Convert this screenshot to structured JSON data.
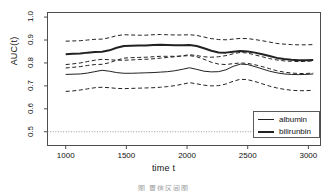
{
  "chart_data": {
    "type": "line",
    "title": "",
    "xlabel": "time t",
    "ylabel": "AUC(t)",
    "xlim": [
      850,
      3100
    ],
    "ylim": [
      0.44,
      1.02
    ],
    "xticks": [
      "1000",
      "1500",
      "2000",
      "2500",
      "3000"
    ],
    "xtick_values": [
      1000,
      1500,
      2000,
      2500,
      3000
    ],
    "yticks": [
      "0.5",
      "0.6",
      "0.7",
      "0.8",
      "0.9",
      "1.0"
    ],
    "ytick_values": [
      0.5,
      0.6,
      0.7,
      0.8,
      0.9,
      1.0
    ],
    "grid": false,
    "legend_position": "bottom-right",
    "reference_line": {
      "y": 0.5,
      "style": "dotted",
      "color": "#999999"
    },
    "series": [
      {
        "name": "albumin",
        "style": "solid",
        "width": 1,
        "color": "#222222",
        "x": [
          1000,
          1060,
          1120,
          1180,
          1240,
          1300,
          1360,
          1420,
          1480,
          1540,
          1600,
          1660,
          1720,
          1780,
          1840,
          1900,
          1960,
          2020,
          2080,
          2140,
          2200,
          2260,
          2320,
          2380,
          2440,
          2500,
          2560,
          2620,
          2680,
          2740,
          2800,
          2860,
          2920,
          2980,
          3040
        ],
        "values": [
          0.75,
          0.751,
          0.752,
          0.756,
          0.762,
          0.768,
          0.764,
          0.758,
          0.755,
          0.755,
          0.756,
          0.757,
          0.758,
          0.76,
          0.762,
          0.766,
          0.772,
          0.779,
          0.772,
          0.764,
          0.761,
          0.762,
          0.77,
          0.785,
          0.795,
          0.793,
          0.784,
          0.774,
          0.764,
          0.757,
          0.752,
          0.75,
          0.749,
          0.75,
          0.752
        ]
      },
      {
        "name": "bilirunbin",
        "style": "solid",
        "width": 2,
        "color": "#222222",
        "x": [
          1000,
          1060,
          1120,
          1180,
          1240,
          1300,
          1360,
          1420,
          1480,
          1540,
          1600,
          1660,
          1720,
          1780,
          1840,
          1900,
          1960,
          2020,
          2080,
          2140,
          2200,
          2260,
          2320,
          2380,
          2440,
          2500,
          2560,
          2620,
          2680,
          2740,
          2800,
          2860,
          2920,
          2980,
          3040
        ],
        "values": [
          0.838,
          0.84,
          0.841,
          0.845,
          0.848,
          0.849,
          0.855,
          0.866,
          0.874,
          0.875,
          0.876,
          0.876,
          0.878,
          0.879,
          0.878,
          0.877,
          0.877,
          0.878,
          0.874,
          0.864,
          0.853,
          0.846,
          0.845,
          0.849,
          0.852,
          0.85,
          0.845,
          0.838,
          0.83,
          0.822,
          0.817,
          0.814,
          0.812,
          0.812,
          0.813
        ]
      },
      {
        "name": "albumin-upper-ci",
        "style": "dashed",
        "width": 1,
        "color": "#222222",
        "x": [
          1000,
          1060,
          1120,
          1180,
          1240,
          1300,
          1360,
          1420,
          1480,
          1540,
          1600,
          1660,
          1720,
          1780,
          1840,
          1900,
          1960,
          2020,
          2080,
          2140,
          2200,
          2260,
          2320,
          2380,
          2440,
          2500,
          2560,
          2620,
          2680,
          2740,
          2800,
          2860,
          2920,
          2980,
          3040
        ],
        "values": [
          0.793,
          0.796,
          0.8,
          0.806,
          0.812,
          0.816,
          0.814,
          0.812,
          0.812,
          0.813,
          0.815,
          0.816,
          0.818,
          0.821,
          0.824,
          0.827,
          0.831,
          0.836,
          0.832,
          0.827,
          0.825,
          0.827,
          0.832,
          0.84,
          0.846,
          0.843,
          0.835,
          0.827,
          0.819,
          0.813,
          0.809,
          0.807,
          0.806,
          0.807,
          0.809
        ]
      },
      {
        "name": "albumin-lower-ci",
        "style": "dashed",
        "width": 1,
        "color": "#222222",
        "x": [
          1000,
          1060,
          1120,
          1180,
          1240,
          1300,
          1360,
          1420,
          1480,
          1540,
          1600,
          1660,
          1720,
          1780,
          1840,
          1900,
          1960,
          2020,
          2080,
          2140,
          2200,
          2260,
          2320,
          2380,
          2440,
          2500,
          2560,
          2620,
          2680,
          2740,
          2800,
          2860,
          2920,
          2980,
          3040
        ],
        "values": [
          0.676,
          0.678,
          0.682,
          0.687,
          0.692,
          0.694,
          0.692,
          0.689,
          0.688,
          0.689,
          0.69,
          0.691,
          0.692,
          0.694,
          0.697,
          0.701,
          0.707,
          0.714,
          0.709,
          0.703,
          0.7,
          0.701,
          0.708,
          0.72,
          0.729,
          0.727,
          0.719,
          0.709,
          0.699,
          0.691,
          0.685,
          0.681,
          0.679,
          0.679,
          0.681
        ]
      },
      {
        "name": "bilirunbin-upper-ci",
        "style": "dashed",
        "width": 1,
        "color": "#222222",
        "x": [
          1000,
          1060,
          1120,
          1180,
          1240,
          1300,
          1360,
          1420,
          1480,
          1540,
          1600,
          1660,
          1720,
          1780,
          1840,
          1900,
          1960,
          2020,
          2080,
          2140,
          2200,
          2260,
          2320,
          2380,
          2440,
          2500,
          2560,
          2620,
          2680,
          2740,
          2800,
          2860,
          2920,
          2980,
          3040
        ],
        "values": [
          0.895,
          0.896,
          0.897,
          0.9,
          0.903,
          0.904,
          0.91,
          0.919,
          0.923,
          0.922,
          0.921,
          0.921,
          0.923,
          0.924,
          0.923,
          0.922,
          0.922,
          0.923,
          0.92,
          0.913,
          0.906,
          0.902,
          0.901,
          0.904,
          0.907,
          0.906,
          0.902,
          0.897,
          0.891,
          0.885,
          0.882,
          0.88,
          0.879,
          0.879,
          0.88
        ]
      },
      {
        "name": "bilirunbin-lower-ci",
        "style": "dashed",
        "width": 1,
        "color": "#222222",
        "x": [
          1000,
          1060,
          1120,
          1180,
          1240,
          1300,
          1360,
          1420,
          1480,
          1540,
          1600,
          1660,
          1720,
          1780,
          1840,
          1900,
          1960,
          2020,
          2080,
          2140,
          2200,
          2260,
          2320,
          2380,
          2440,
          2500,
          2560,
          2620,
          2680,
          2740,
          2800,
          2860,
          2920,
          2980,
          3040
        ],
        "values": [
          0.778,
          0.781,
          0.784,
          0.789,
          0.793,
          0.794,
          0.801,
          0.812,
          0.821,
          0.823,
          0.824,
          0.825,
          0.827,
          0.829,
          0.829,
          0.829,
          0.83,
          0.832,
          0.827,
          0.816,
          0.803,
          0.795,
          0.793,
          0.797,
          0.8,
          0.798,
          0.792,
          0.784,
          0.775,
          0.766,
          0.76,
          0.756,
          0.754,
          0.754,
          0.756
        ]
      }
    ],
    "legend": [
      {
        "label": "albumin",
        "style": "solid",
        "width": 1
      },
      {
        "label": "bilirunbin",
        "style": "solid",
        "width": 2
      }
    ]
  },
  "caption": {
    "text": "图 置信区间图"
  }
}
